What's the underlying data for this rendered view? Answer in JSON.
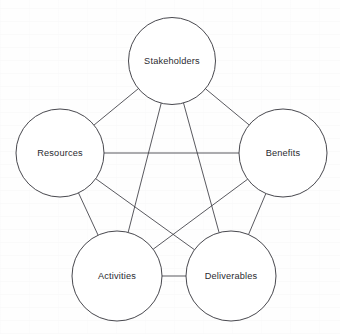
{
  "diagram": {
    "type": "network-graph",
    "shape": "pentagon-complete-graph",
    "background_color": "#fefefe",
    "line_color": "#3b3b42",
    "node_fill_color": "#ffffff",
    "node_stroke_color": "#33333a",
    "label_color": "#2a2a30",
    "nodes": [
      {
        "id": "stakeholders",
        "label": "Stakeholders",
        "cx": 172,
        "cy": 61,
        "r": 43.5,
        "position": "top"
      },
      {
        "id": "resources",
        "label": "Resources",
        "cx": 60,
        "cy": 153,
        "r": 44,
        "position": "upper-left"
      },
      {
        "id": "benefits",
        "label": "Benefits",
        "cx": 283,
        "cy": 153,
        "r": 44,
        "position": "upper-right"
      },
      {
        "id": "activities",
        "label": "Activities",
        "cx": 117,
        "cy": 276,
        "r": 45,
        "position": "lower-left"
      },
      {
        "id": "deliverables",
        "label": "Deliverables",
        "cx": 231,
        "cy": 276,
        "r": 45,
        "position": "lower-right"
      }
    ],
    "edges": [
      {
        "id": "edge-stakeholders-resources",
        "from": "stakeholders",
        "to": "resources",
        "kind": "pentagon-side"
      },
      {
        "id": "edge-stakeholders-benefits",
        "from": "stakeholders",
        "to": "benefits",
        "kind": "pentagon-side"
      },
      {
        "id": "edge-resources-activities",
        "from": "resources",
        "to": "activities",
        "kind": "pentagon-side"
      },
      {
        "id": "edge-benefits-deliverables",
        "from": "benefits",
        "to": "deliverables",
        "kind": "pentagon-side"
      },
      {
        "id": "edge-activities-deliverables",
        "from": "activities",
        "to": "deliverables",
        "kind": "pentagon-side"
      },
      {
        "id": "edge-stakeholders-activities",
        "from": "stakeholders",
        "to": "activities",
        "kind": "diagonal"
      },
      {
        "id": "edge-stakeholders-deliverables",
        "from": "stakeholders",
        "to": "deliverables",
        "kind": "diagonal"
      },
      {
        "id": "edge-resources-benefits",
        "from": "resources",
        "to": "benefits",
        "kind": "diagonal"
      },
      {
        "id": "edge-resources-deliverables",
        "from": "resources",
        "to": "deliverables",
        "kind": "diagonal"
      },
      {
        "id": "edge-benefits-activities",
        "from": "benefits",
        "to": "activities",
        "kind": "diagonal"
      }
    ]
  }
}
